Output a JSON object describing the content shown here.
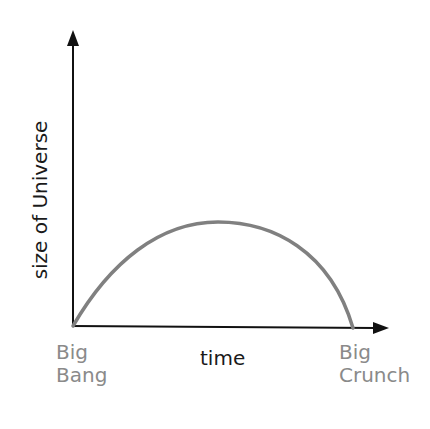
{
  "diagram": {
    "title": "",
    "y_axis_label": "size of Universe",
    "x_axis_label": "time",
    "start_label": {
      "line1": "Big",
      "line2": "Bang"
    },
    "end_label": {
      "line1": "Big",
      "line2": "Crunch"
    },
    "colors": {
      "axis": "#111111",
      "curve": "#808080",
      "event_labels": "#8a8a8a",
      "axis_labels": "#1a1a1a"
    },
    "curve_description": "Universe size rises from zero at the Big Bang, peaks midway, and falls back to zero at the Big Crunch"
  }
}
